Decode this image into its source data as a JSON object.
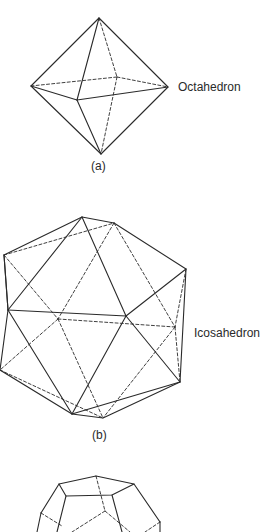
{
  "figures": [
    {
      "id": "a",
      "name": "Octahedron",
      "caption": "(a)"
    },
    {
      "id": "b",
      "name": "Icosahedron",
      "caption": "(b)"
    },
    {
      "id": "c",
      "name": "Dodecahedron",
      "caption": ""
    }
  ],
  "labels": {
    "octahedron": "Octahedron",
    "icosahedron": "Icosahedron"
  },
  "captions": {
    "a": "(a)",
    "b": "(b)"
  },
  "colors": {
    "line": "#2a2a2a",
    "background": "#ffffff"
  }
}
